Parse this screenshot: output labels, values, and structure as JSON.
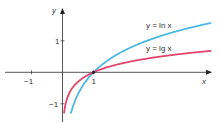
{
  "chart_data": {
    "type": "line",
    "title": "",
    "xlabel": "x",
    "ylabel": "y",
    "xlim": [
      -2,
      4.8
    ],
    "ylim": [
      -1.35,
      2.0
    ],
    "x_ticks": [
      {
        "value": -1,
        "label": "−1"
      },
      {
        "value": 1,
        "label": "1"
      }
    ],
    "y_ticks": [
      {
        "value": 1,
        "label": "1"
      },
      {
        "value": -1,
        "label": "−1"
      }
    ],
    "grid": false,
    "series": [
      {
        "name": "y = ln x",
        "function": "ln",
        "color": "#4db8e3",
        "x": [
          0.27,
          0.5,
          1,
          1.5,
          2,
          3,
          4,
          4.8
        ],
        "y": [
          -1.31,
          -0.69,
          0,
          0.41,
          0.69,
          1.1,
          1.39,
          1.57
        ]
      },
      {
        "name": "y = lg x",
        "function": "log10",
        "color": "#e2456d",
        "x": [
          0.05,
          0.1,
          0.2,
          0.5,
          1,
          2,
          3,
          4,
          4.8
        ],
        "y": [
          -1.3,
          -1.0,
          -0.7,
          -0.3,
          0,
          0.3,
          0.48,
          0.6,
          0.68
        ]
      }
    ],
    "annotations": [
      {
        "text": "y = ln x",
        "series": 0
      },
      {
        "text": "y = lg x",
        "series": 1
      },
      {
        "text": "intersection point",
        "x": 1,
        "y": 0
      }
    ]
  },
  "labels": {
    "y_axis": "y",
    "x_axis": "x",
    "ln_label": "y = ln x",
    "lg_label": "y = lg x",
    "tick_x_neg1": "−1",
    "tick_x_1": "1",
    "tick_y_1": "1",
    "tick_y_neg1": "−1"
  }
}
